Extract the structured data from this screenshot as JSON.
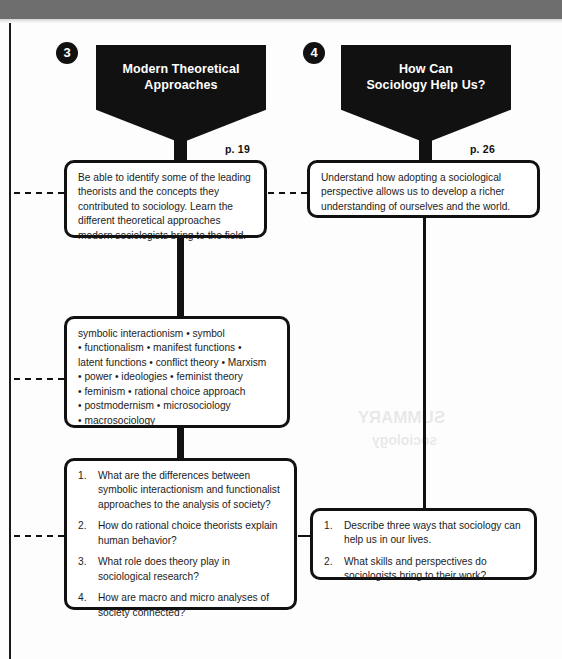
{
  "page": {
    "background_color": "#fdfdfd",
    "ink_color": "#111111",
    "top_band_color": "#6e6e6e"
  },
  "columns": [
    {
      "badge": "3",
      "title": "Modern Theoretical Approaches",
      "title_line1": "Modern Theoretical",
      "title_line2": "Approaches",
      "page_ref": "p. 19",
      "objective": "Be able to identify some of the leading theorists and the concepts they contributed to sociology. Learn the different theoretical approaches modern sociologists bring to the field.",
      "keywords_lines": [
        "symbolic interactionism • symbol",
        "• functionalism • manifest functions •",
        "latent functions • conflict theory • Marxism",
        "• power • ideologies • feminist theory",
        "• feminism • rational choice approach",
        "• postmodernism • microsociology",
        "• macrosociology"
      ],
      "questions": [
        {
          "num": "1.",
          "text": "What are the differences between symbolic interactionism and functionalist approaches to the analysis of society?"
        },
        {
          "num": "2.",
          "text": "How do rational choice theorists explain human behavior?"
        },
        {
          "num": "3.",
          "text": "What role does theory play in sociological research?"
        },
        {
          "num": "4.",
          "text": "How are macro and micro analyses of society connected?"
        }
      ]
    },
    {
      "badge": "4",
      "title": "How Can Sociology Help Us?",
      "title_line1": "How Can",
      "title_line2": "Sociology Help Us?",
      "page_ref": "p. 26",
      "objective": "Understand how adopting a sociological perspective allows us to develop a richer understanding of ourselves and the world.",
      "questions": [
        {
          "num": "1.",
          "text": "Describe three ways that sociology can help us in our lives."
        },
        {
          "num": "2.",
          "text": "What skills and perspectives do sociologists bring to their work?"
        }
      ]
    }
  ]
}
